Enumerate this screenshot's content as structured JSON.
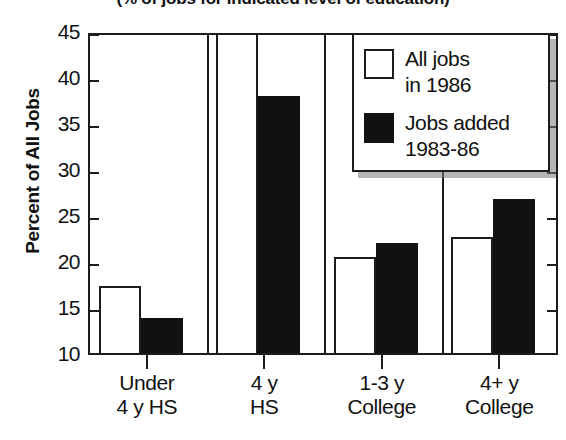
{
  "chart_data": {
    "type": "bar",
    "title": "(% of jobs for indicated level of education)",
    "xlabel": "",
    "ylabel": "Percent of All Jobs",
    "ylim": [
      10,
      45
    ],
    "ytick_values": [
      10,
      15,
      20,
      25,
      30,
      35,
      40,
      45
    ],
    "ytick_labels": [
      "10",
      "15",
      "20",
      "25",
      "30",
      "35",
      "40",
      "45"
    ],
    "grid": false,
    "legend_position": "top-right",
    "categories": [
      "Under 4 y HS",
      "4 y HS",
      "1-3 y College",
      "4+ y College"
    ],
    "category_lines": [
      [
        "Under",
        "4 y HS"
      ],
      [
        "4 y",
        "HS"
      ],
      [
        "1-3 y",
        "College"
      ],
      [
        "4+ y",
        "College"
      ]
    ],
    "series": [
      {
        "name": "All jobs in 1986",
        "name_lines": [
          "All jobs",
          "in 1986"
        ],
        "style": "open",
        "color": "#ffffff",
        "edge_color": "#1c1c1c",
        "values": [
          17.3,
          45.5,
          20.4,
          22.6
        ],
        "clipped": [
          false,
          true,
          false,
          false
        ]
      },
      {
        "name": "Jobs added 1983-86",
        "name_lines": [
          "Jobs added",
          "1983-86"
        ],
        "style": "solid",
        "color": "#111111",
        "edge_color": "#111111",
        "values": [
          13.8,
          37.9,
          22.0,
          26.7
        ],
        "clipped": [
          false,
          false,
          false,
          false
        ]
      }
    ]
  },
  "axis": {
    "y_title": "Percent of All Jobs"
  }
}
